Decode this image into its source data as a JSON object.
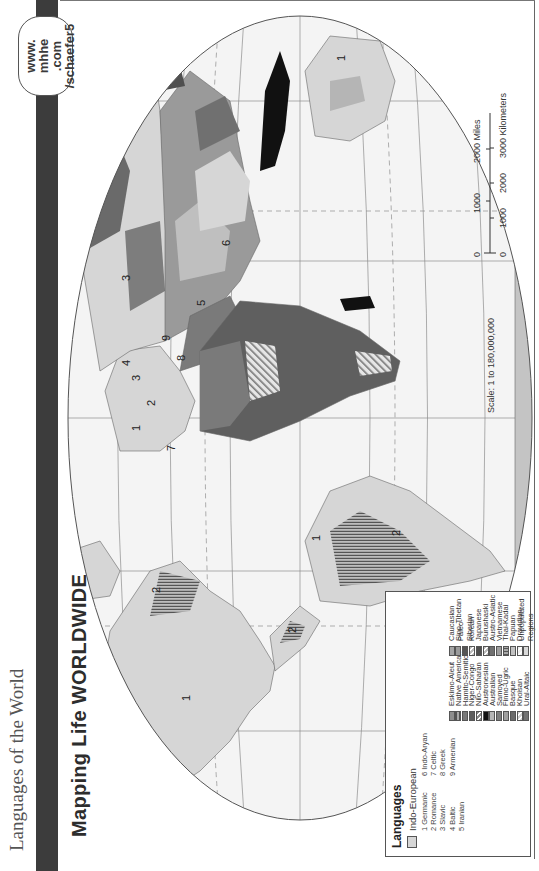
{
  "page": {
    "running_head": "Languages of the World",
    "title": "Mapping Life WORLDWIDE",
    "badge": [
      "www.",
      "mhhe",
      ".com",
      "/schaefer5"
    ],
    "orientation": "rotated 90° counter-clockwise"
  },
  "legend": {
    "title": "Languages",
    "indo_european": {
      "label": "Indo-European",
      "color": "#d6d6d6",
      "subgroups_left": [
        "1  Germanic",
        "2  Romance",
        "3  Slavic",
        "4  Baltic",
        "5  Iranian"
      ],
      "subgroups_right": [
        "6  Indo-Aryan",
        "7  Celtic",
        "8  Greek",
        "9  Armenian"
      ]
    },
    "left_column": [
      {
        "label": "Eskimo-Aleut",
        "color": "#8e8e8e",
        "pattern": "solid"
      },
      {
        "label": "Native American",
        "color": "#a9a9a9",
        "pattern": "horizontal-lines"
      },
      {
        "label": "Hamito-Semitic",
        "color": "#7a7a7a",
        "pattern": "solid"
      },
      {
        "label": "Niger-Congo",
        "color": "#5f5f5f",
        "pattern": "solid"
      },
      {
        "label": "Nilo-Saharan",
        "color": "#8a8a8a",
        "pattern": "diagonal"
      },
      {
        "label": "Austronesian",
        "color": "#111111",
        "pattern": "solid"
      },
      {
        "label": "Australian",
        "color": "#b5b5b5",
        "pattern": "solid"
      },
      {
        "label": "Samoyed",
        "color": "#7d7d7d",
        "pattern": "solid"
      },
      {
        "label": "Finno-Ugric",
        "color": "#a0a0a0",
        "pattern": "solid"
      },
      {
        "label": "Basque",
        "color": "#6a6a6a",
        "pattern": "solid"
      },
      {
        "label": "Khoisan",
        "color": "#d0d0d0",
        "pattern": "diagonal"
      },
      {
        "label": "Ural-Altaic",
        "color": "#727272",
        "pattern": "solid"
      }
    ],
    "right_column": [
      {
        "label": "Caucasian",
        "color": "#a5a5a5",
        "pattern": "solid"
      },
      {
        "label": "Sino-Tibetan",
        "color": "#9a9a9a",
        "pattern": "solid"
      },
      {
        "label": "Paleo-Siberian",
        "color": "#555555",
        "pattern": "solid"
      },
      {
        "label": "Korean",
        "color": "#bdbdbd",
        "pattern": "diagonal"
      },
      {
        "label": "Japanese",
        "color": "#4f4f4f",
        "pattern": "solid"
      },
      {
        "label": "Burushaski",
        "color": "#bcbcbc",
        "pattern": "diagonal"
      },
      {
        "label": "Austro-Asiatic",
        "color": "#707070",
        "pattern": "solid"
      },
      {
        "label": "Vietnamese",
        "color": "#9e9e9e",
        "pattern": "solid"
      },
      {
        "label": "Thai-Kadai",
        "color": "#a8a8a8",
        "pattern": "vertical-lines"
      },
      {
        "label": "Papuan",
        "color": "#c2c2c2",
        "pattern": "solid"
      },
      {
        "label": "Dravidian",
        "color": "#f0f0f0",
        "pattern": "diagonal-light"
      },
      {
        "label": "Unpopulated Regions",
        "color": "#d9d9d9",
        "pattern": "solid"
      }
    ]
  },
  "scale": {
    "ratio": "Scale:  1 to 180,000,000",
    "miles_ticks": [
      "0",
      "1000",
      "2000 Miles"
    ],
    "km_ticks": [
      "0",
      "1000",
      "2000",
      "3000 Kilometers"
    ]
  },
  "map_labels": {
    "north_america": "1",
    "mexico": "2",
    "central_america": "2",
    "brazil": "2",
    "south_america_north": "1",
    "europe": [
      "1",
      "1",
      "1",
      "2",
      "2",
      "3",
      "3",
      "4",
      "7",
      "8",
      "9"
    ],
    "russia": "3",
    "iran": "5",
    "india": "6",
    "australia": "1"
  },
  "colors": {
    "band": "#3c3c3c",
    "ocean": "#f3f3f3",
    "land_unpopulated": "#d9d9d9",
    "graticule": "#8a8a8a"
  }
}
